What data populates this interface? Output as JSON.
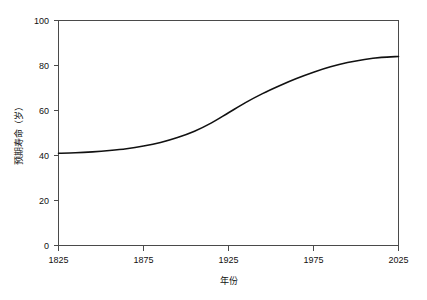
{
  "chart_data": {
    "type": "line",
    "title": "",
    "subtitle": "",
    "xlabel": "年份",
    "ylabel": "预期寿命（岁）",
    "xlim": [
      1825,
      2025
    ],
    "ylim": [
      0,
      100
    ],
    "grid": false,
    "legend": null,
    "legend_position": "none",
    "x_ticks": [
      1825,
      1875,
      1925,
      1975,
      2025
    ],
    "x_tick_labels": [
      "1825",
      "1875",
      "1925",
      "1975",
      "2025"
    ],
    "y_ticks": [
      0,
      20,
      40,
      60,
      80,
      100
    ],
    "y_tick_labels": [
      "0",
      "20",
      "40",
      "60",
      "80",
      "100"
    ],
    "line_color": "#111111",
    "axis_color": "#4a4a4a",
    "series": [
      {
        "name": "预期寿命",
        "x": [
          1825,
          1835,
          1845,
          1855,
          1865,
          1875,
          1885,
          1895,
          1905,
          1915,
          1925,
          1935,
          1945,
          1955,
          1965,
          1975,
          1985,
          1995,
          2005,
          2015,
          2025
        ],
        "values": [
          41.0,
          41.2,
          41.6,
          42.2,
          43.0,
          44.2,
          45.8,
          48.0,
          50.8,
          54.5,
          59.0,
          63.5,
          67.5,
          71.0,
          74.2,
          77.0,
          79.4,
          81.3,
          82.7,
          83.6,
          84.0
        ]
      }
    ],
    "annotations": []
  },
  "axis_titles": {
    "x": "年份",
    "y": "预期寿命（岁）"
  }
}
